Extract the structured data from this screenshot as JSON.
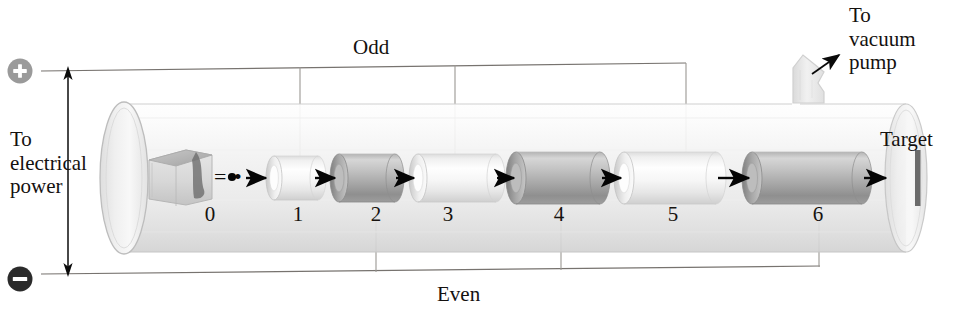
{
  "figure": {
    "type": "linear-accelerator-schematic",
    "width": 973,
    "height": 312
  },
  "labels": {
    "to_electrical_power": "To\nelectrical\npower",
    "to_vacuum_pump": "To\nvacuum\npump",
    "odd": "Odd",
    "even": "Even",
    "target": "Target",
    "source_equals_dot": "= •"
  },
  "polarity": {
    "plus_symbol": "+",
    "minus_symbol": "−",
    "plus_circle_color": "#8e8e8e",
    "minus_circle_color": "#2e2e2e"
  },
  "drift_tubes": [
    {
      "number": "0",
      "parity": "source",
      "shade": "source-block",
      "x": 210
    },
    {
      "number": "1",
      "parity": "odd",
      "shade": "light",
      "x": 297
    },
    {
      "number": "2",
      "parity": "even",
      "shade": "dark",
      "x": 375
    },
    {
      "number": "3",
      "parity": "odd",
      "shade": "light",
      "x": 447
    },
    {
      "number": "4",
      "parity": "even",
      "shade": "dark",
      "x": 558
    },
    {
      "number": "5",
      "parity": "odd",
      "shade": "light",
      "x": 672
    },
    {
      "number": "6",
      "parity": "even",
      "shade": "dark",
      "x": 817
    }
  ],
  "colors": {
    "tube_light": "#f1f1f1",
    "tube_dark": "#a9a9a9",
    "vessel_glass": "#f4f4f4",
    "vessel_outline": "#c9c9c9",
    "wire": "#6d6a68",
    "arrow": "#060606",
    "target_bar": "#6b6b6b"
  },
  "wiring": {
    "odd_bus_y": 68,
    "even_bus_y": 277,
    "odd_taps_x": [
      300,
      455,
      685
    ],
    "even_taps_x": [
      375,
      560,
      818
    ],
    "vertical_arrow_x": 68
  }
}
